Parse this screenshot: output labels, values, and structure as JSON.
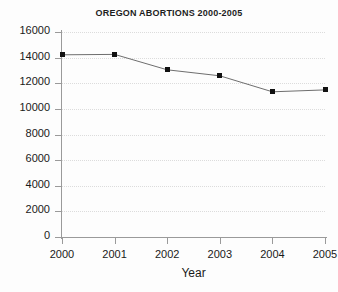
{
  "chart_data": {
    "type": "line",
    "title": "OREGON ABORTIONS 2000-2005",
    "xlabel": "Year",
    "ylabel": "",
    "categories": [
      "2000",
      "2001",
      "2002",
      "2003",
      "2004",
      "2005"
    ],
    "values": [
      14220,
      14250,
      13050,
      12580,
      11330,
      11480
    ],
    "series": [
      {
        "name": "Oregon abortions",
        "values": [
          14220,
          14250,
          13050,
          12580,
          11330,
          11480
        ]
      }
    ],
    "ylim": [
      0,
      16000
    ],
    "y_ticks": [
      0,
      2000,
      4000,
      6000,
      8000,
      10000,
      12000,
      14000,
      16000
    ],
    "y_tick_labels": [
      "0",
      "2000",
      "4000",
      "6000",
      "8000",
      "10000",
      "12000",
      "14000",
      "16000"
    ],
    "x_tick_labels": [
      "2000",
      "2001",
      "2002",
      "2003",
      "2004",
      "2005"
    ],
    "grid": true,
    "grid_style": "dotted-horizontal",
    "legend": false,
    "legend_position": "none",
    "marker": "square",
    "colors": {
      "line": "#6e6e6e",
      "marker": "#111111",
      "grid": "#dcdcdc",
      "axis": "#9a9a9a",
      "text": "#1a1a1a",
      "background": "#fdfdfd"
    }
  }
}
